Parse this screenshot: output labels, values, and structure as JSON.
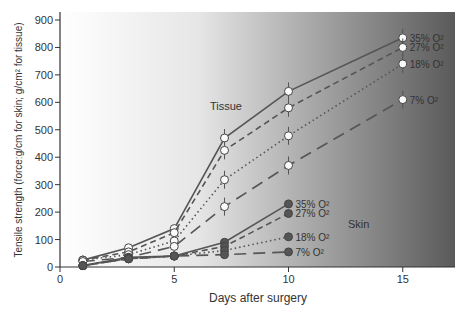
{
  "chart_data": {
    "type": "line",
    "title": "",
    "xlabel": "Days after surgery",
    "ylabel": "Tensile strength (force:g/cm for skin; g/cm² for tissue)",
    "xlim": [
      0,
      17.2
    ],
    "ylim": [
      0,
      900
    ],
    "x_ticks": [
      "0",
      "5",
      "10",
      "15"
    ],
    "y_ticks": [
      "0",
      "100",
      "200",
      "300",
      "400",
      "500",
      "600",
      "700",
      "800",
      "900"
    ],
    "grid": false,
    "annotations": [
      "Tissue",
      "Skin"
    ],
    "series": [
      {
        "name": "Tissue 35% O2",
        "label": "35% O²",
        "group": "tissue",
        "style": "solid",
        "x": [
          1,
          3,
          5,
          7.2,
          10,
          15
        ],
        "values": [
          25,
          70,
          140,
          470,
          640,
          835
        ]
      },
      {
        "name": "Tissue 27% O2",
        "label": "27% O²",
        "group": "tissue",
        "style": "dashed",
        "x": [
          1,
          3,
          5,
          7.2,
          10,
          15
        ],
        "values": [
          25,
          55,
          125,
          425,
          580,
          800
        ]
      },
      {
        "name": "Tissue 18% O2",
        "label": "18% O²",
        "group": "tissue",
        "style": "dotted",
        "x": [
          1,
          3,
          5,
          7.2,
          10,
          15
        ],
        "values": [
          25,
          45,
          95,
          318,
          478,
          740
        ]
      },
      {
        "name": "Tissue 7% O2",
        "label": "7% O²",
        "group": "tissue",
        "style": "longdash",
        "x": [
          1,
          3,
          5,
          7.2,
          10,
          15
        ],
        "values": [
          20,
          35,
          75,
          220,
          370,
          610
        ]
      },
      {
        "name": "Skin 35% O2",
        "label": "35% O²",
        "group": "skin",
        "style": "solid",
        "x": [
          1,
          3,
          5,
          7.2,
          10
        ],
        "values": [
          5,
          35,
          40,
          90,
          230
        ]
      },
      {
        "name": "Skin 27% O2",
        "label": "27% O²",
        "group": "skin",
        "style": "dashed",
        "x": [
          1,
          3,
          5,
          7.2,
          10
        ],
        "values": [
          5,
          30,
          40,
          75,
          195
        ]
      },
      {
        "name": "Skin 18% O2",
        "label": "18% O²",
        "group": "skin",
        "style": "dotted",
        "x": [
          1,
          3,
          5,
          7.2,
          10
        ],
        "values": [
          5,
          30,
          40,
          60,
          110
        ]
      },
      {
        "name": "Skin 7% O2",
        "label": "7% O²",
        "group": "skin",
        "style": "longdash",
        "x": [
          1,
          3,
          5,
          7.2,
          10
        ],
        "values": [
          5,
          30,
          40,
          45,
          55
        ]
      }
    ]
  }
}
